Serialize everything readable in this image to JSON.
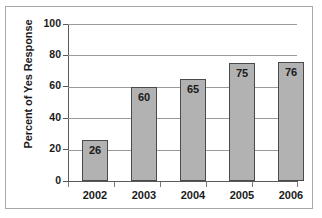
{
  "chart_data": {
    "type": "bar",
    "title": "",
    "title_clipped_note": "",
    "xlabel": "",
    "ylabel": "Percent of Yes Response",
    "categories": [
      "2002",
      "2003",
      "2004",
      "2005",
      "2006"
    ],
    "values": [
      26,
      60,
      65,
      75,
      76
    ],
    "data_labels": [
      "26",
      "60",
      "65",
      "75",
      "76"
    ],
    "ylim": [
      0,
      100
    ],
    "ytick_labels": [
      "0",
      "20",
      "40",
      "60",
      "80",
      "100"
    ],
    "ytick_values": [
      0,
      20,
      40,
      60,
      80,
      100
    ],
    "grid": true,
    "grid_axis": "y",
    "legend": false,
    "legend_position": "none",
    "series": [
      {
        "name": "Percent of Yes Response",
        "values": [
          26,
          60,
          65,
          75,
          76
        ]
      }
    ],
    "colors": {
      "bar_fill": "#b2b2b2",
      "bar_border": "#4a4a4a",
      "gridline": "#9a9a9a",
      "axis": "#5a5a5a",
      "text": "#1a1a1a",
      "frame": "#a8a8a8",
      "background": "#ffffff"
    }
  }
}
